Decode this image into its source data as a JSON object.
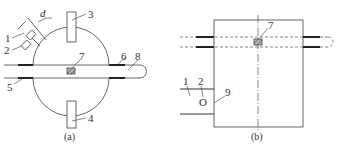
{
  "figure": {
    "panel_a": {
      "caption": "(a)",
      "labels": {
        "l1": "1",
        "l2": "2",
        "ld": "d",
        "l3": "3",
        "l4": "4",
        "l5": "5",
        "l6": "6",
        "l7": "7",
        "l8": "8"
      }
    },
    "panel_b": {
      "caption": "(b)",
      "labels": {
        "l1": "1",
        "l2": "2",
        "l7": "7",
        "l9": "9",
        "port": "O"
      }
    }
  },
  "colors": {
    "line": "#555555",
    "thick": "#222222",
    "sample_fill": "#888888"
  }
}
